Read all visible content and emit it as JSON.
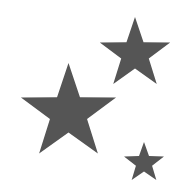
{
  "image": {
    "description": "Three five-pointed stars",
    "width": 183,
    "height": 192,
    "background": "#ffffff"
  },
  "stars": [
    {
      "name": "large-star",
      "cx": 68.5,
      "cy": 113,
      "outer_r": 50,
      "inner_r": 19.5,
      "color": "#555555"
    },
    {
      "name": "medium-star",
      "cx": 135,
      "cy": 54,
      "outer_r": 37,
      "inner_r": 14.5,
      "color": "#555555"
    },
    {
      "name": "small-star",
      "cx": 144,
      "cy": 163,
      "outer_r": 21,
      "inner_r": 8.5,
      "color": "#555555"
    }
  ]
}
